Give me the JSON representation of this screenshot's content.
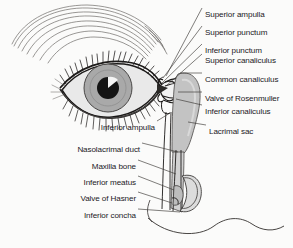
{
  "figure": {
    "background_color": "#fbfbfa",
    "ink_color": "#23201e",
    "fill_gray": "#b9b9b9",
    "fill_gray_light": "#cfcfcf",
    "iris_color": "#a8a8a8",
    "pupil_color": "#141414",
    "sclera_color": "#e8e8e8"
  },
  "labels_right": [
    {
      "id": "superior-ampulla",
      "text": "Superior ampulla",
      "x": 205,
      "y": 10
    },
    {
      "id": "superior-punctum",
      "text": "Superior punctum",
      "x": 205,
      "y": 28
    },
    {
      "id": "inferior-punctum",
      "text": "Inferior punctum",
      "x": 205,
      "y": 46
    },
    {
      "id": "superior-canaliculus",
      "text": "Superior canaliculus",
      "x": 205,
      "y": 56
    },
    {
      "id": "common-canaliculus",
      "text": "Common canaliculus",
      "x": 205,
      "y": 75
    },
    {
      "id": "valve-of-rosenmuller",
      "text": "Valve of Rosenmuller",
      "x": 205,
      "y": 94
    },
    {
      "id": "inferior-canaliculus",
      "text": "Inferior canaliculus",
      "x": 205,
      "y": 107
    },
    {
      "id": "lacrimal-sac",
      "text": "Lacrimal sac",
      "x": 209,
      "y": 127
    }
  ],
  "labels_left": [
    {
      "id": "inferior-ampulla",
      "text": "Inferior ampulla",
      "right": 155,
      "y": 123
    },
    {
      "id": "nasolacrimal-duct",
      "text": "Nasolacrimal duct",
      "right": 140,
      "y": 145
    },
    {
      "id": "maxilla-bone",
      "text": "Maxilla bone",
      "right": 136,
      "y": 162
    },
    {
      "id": "inferior-meatus",
      "text": "Inferior meatus",
      "right": 136,
      "y": 178
    },
    {
      "id": "valve-of-hasner",
      "text": "Valve of Hasner",
      "right": 136,
      "y": 194
    },
    {
      "id": "inferior-concha",
      "text": "Inferior concha",
      "right": 136,
      "y": 211
    }
  ],
  "leaders_right": [
    {
      "id": "leader-superior-ampulla",
      "x1": 202,
      "y1": 8,
      "x2": 166,
      "y2": 76
    },
    {
      "id": "leader-superior-punctum",
      "x1": 202,
      "y1": 26,
      "x2": 163,
      "y2": 78
    },
    {
      "id": "leader-inferior-punctum",
      "x1": 202,
      "y1": 44,
      "x2": 162,
      "y2": 83
    },
    {
      "id": "leader-superior-canaliculus",
      "x1": 202,
      "y1": 54,
      "x2": 166,
      "y2": 86
    },
    {
      "id": "leader-common-canaliculus",
      "x1": 202,
      "y1": 73,
      "x2": 180,
      "y2": 73
    },
    {
      "id": "leader-valve-rosenmuller",
      "x1": 202,
      "y1": 92,
      "x2": 178,
      "y2": 92
    },
    {
      "id": "leader-inferior-canaliculus",
      "x1": 202,
      "y1": 105,
      "x2": 176,
      "y2": 99
    },
    {
      "id": "leader-lacrimal-sac",
      "x1": 206,
      "y1": 125,
      "x2": 188,
      "y2": 122
    }
  ],
  "leaders_left": [
    {
      "id": "leader-inferior-ampulla",
      "x1": 157,
      "y1": 121,
      "x2": 170,
      "y2": 113
    },
    {
      "id": "leader-nasolacrimal-duct",
      "x1": 142,
      "y1": 143,
      "x2": 178,
      "y2": 152
    },
    {
      "id": "leader-maxilla-bone",
      "x1": 138,
      "y1": 160,
      "x2": 176,
      "y2": 174
    },
    {
      "id": "leader-inferior-meatus",
      "x1": 138,
      "y1": 176,
      "x2": 174,
      "y2": 190
    },
    {
      "id": "leader-valve-hasner",
      "x1": 138,
      "y1": 192,
      "x2": 172,
      "y2": 203
    },
    {
      "id": "leader-inferior-concha",
      "x1": 138,
      "y1": 209,
      "x2": 180,
      "y2": 212
    }
  ]
}
